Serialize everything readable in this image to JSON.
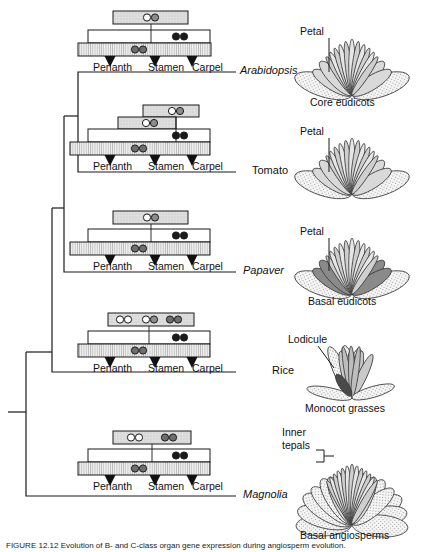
{
  "figure": {
    "caption": "FIGURE 12.12  Evolution of B- and C-class organ gene expression during angiosperm evolution."
  },
  "organ_labels": {
    "perianth": "Perianth",
    "stamen": "Stamen",
    "carpel": "Carpel"
  },
  "panels": [
    {
      "id": "arabidopsis",
      "taxon": "Arabidopsis",
      "taxon_italic": true,
      "clade": "Core eudicots",
      "callout": "Petal",
      "flower_type": "radial-eudicot",
      "petal_shade": "light",
      "bars": [
        {
          "role": "A",
          "x": 113,
          "y": 11,
          "w": 75,
          "h": 13,
          "fill": "#dedede",
          "hatch": "coarse",
          "circles": [
            {
              "dx": 34,
              "fill": "#ffffff"
            },
            {
              "dx": 42,
              "fill": "#8c8c8c"
            }
          ]
        },
        {
          "role": "B",
          "x": 88,
          "y": 30,
          "w": 122,
          "h": 13,
          "fill": "#ffffff",
          "hatch": "none",
          "circles": [
            {
              "dx": 88,
              "fill": "#1a1a1a"
            },
            {
              "dx": 96,
              "fill": "#1a1a1a"
            }
          ]
        },
        {
          "role": "C",
          "x": 78,
          "y": 43,
          "w": 133,
          "h": 13,
          "fill": "#e8e8e8",
          "hatch": "fine",
          "circles": [
            {
              "dx": 57,
              "fill": "#6e6e6e"
            },
            {
              "dx": 65,
              "fill": "#6e6e6e"
            }
          ]
        }
      ],
      "arrows": [
        {
          "x": 110,
          "y": 56
        },
        {
          "x": 155,
          "y": 56
        },
        {
          "x": 192,
          "y": 56
        }
      ],
      "organ_label_y": 62,
      "organ_label_x": [
        93,
        148,
        185
      ]
    },
    {
      "id": "tomato",
      "taxon": "Tomato",
      "taxon_italic": false,
      "clade": "",
      "callout": "Petal",
      "flower_type": "radial-eudicot",
      "petal_shade": "light",
      "bars": [
        {
          "role": "A2",
          "x": 143,
          "y": 105,
          "w": 56,
          "h": 12,
          "fill": "#dedede",
          "hatch": "coarse",
          "circles": [
            {
              "dx": 29,
              "fill": "#ffffff"
            },
            {
              "dx": 37,
              "fill": "#8c8c8c"
            }
          ]
        },
        {
          "role": "A",
          "x": 118,
          "y": 117,
          "w": 58,
          "h": 12,
          "fill": "#dedede",
          "hatch": "coarse",
          "circles": [
            {
              "dx": 28,
              "fill": "#ffffff"
            },
            {
              "dx": 36,
              "fill": "#8c8c8c"
            }
          ]
        },
        {
          "role": "B",
          "x": 88,
          "y": 129,
          "w": 122,
          "h": 13,
          "fill": "#ffffff",
          "hatch": "none",
          "circles": [
            {
              "dx": 88,
              "fill": "#1a1a1a"
            },
            {
              "dx": 96,
              "fill": "#1a1a1a"
            }
          ]
        },
        {
          "role": "C",
          "x": 70,
          "y": 142,
          "w": 140,
          "h": 13,
          "fill": "#e8e8e8",
          "hatch": "fine",
          "circles": [
            {
              "dx": 65,
              "fill": "#6e6e6e"
            },
            {
              "dx": 73,
              "fill": "#6e6e6e"
            }
          ]
        }
      ],
      "arrows": [
        {
          "x": 110,
          "y": 155
        },
        {
          "x": 155,
          "y": 155
        },
        {
          "x": 192,
          "y": 155
        }
      ],
      "organ_label_y": 161,
      "organ_label_x": [
        93,
        148,
        185
      ]
    },
    {
      "id": "papaver",
      "taxon": "Papaver",
      "taxon_italic": true,
      "clade": "Basal eudicots",
      "callout": "Petal",
      "flower_type": "radial-eudicot",
      "petal_shade": "dark",
      "bars": [
        {
          "role": "A",
          "x": 113,
          "y": 211,
          "w": 75,
          "h": 13,
          "fill": "#dedede",
          "hatch": "coarse",
          "circles": [
            {
              "dx": 34,
              "fill": "#ffffff"
            },
            {
              "dx": 42,
              "fill": "#8c8c8c"
            }
          ]
        },
        {
          "role": "B",
          "x": 88,
          "y": 229,
          "w": 122,
          "h": 13,
          "fill": "#ffffff",
          "hatch": "none",
          "circles": [
            {
              "dx": 88,
              "fill": "#1a1a1a"
            },
            {
              "dx": 96,
              "fill": "#1a1a1a"
            }
          ]
        },
        {
          "role": "C",
          "x": 70,
          "y": 242,
          "w": 140,
          "h": 13,
          "fill": "#e8e8e8",
          "hatch": "fine",
          "circles": [
            {
              "dx": 65,
              "fill": "#6e6e6e"
            },
            {
              "dx": 73,
              "fill": "#6e6e6e"
            }
          ]
        }
      ],
      "arrows": [
        {
          "x": 110,
          "y": 255
        },
        {
          "x": 155,
          "y": 255
        },
        {
          "x": 192,
          "y": 255
        }
      ],
      "organ_label_y": 261,
      "organ_label_x": [
        93,
        148,
        185
      ]
    },
    {
      "id": "rice",
      "taxon": "Rice",
      "taxon_italic": false,
      "clade": "Monocot grasses",
      "callout": "Lodicule",
      "flower_type": "grass",
      "petal_shade": "light",
      "bars": [
        {
          "role": "A",
          "x": 108,
          "y": 313,
          "w": 86,
          "h": 13,
          "fill": "#dedede",
          "hatch": "coarse",
          "circles": [
            {
              "dx": 12,
              "fill": "#ffffff"
            },
            {
              "dx": 20,
              "fill": "#ffffff"
            },
            {
              "dx": 38,
              "fill": "#ffffff"
            },
            {
              "dx": 46,
              "fill": "#8c8c8c"
            },
            {
              "dx": 62,
              "fill": "#6e6e6e"
            },
            {
              "dx": 70,
              "fill": "#6e6e6e"
            }
          ]
        },
        {
          "role": "B",
          "x": 88,
          "y": 331,
          "w": 122,
          "h": 13,
          "fill": "#ffffff",
          "hatch": "none",
          "circles": [
            {
              "dx": 88,
              "fill": "#1a1a1a"
            },
            {
              "dx": 96,
              "fill": "#1a1a1a"
            }
          ]
        },
        {
          "role": "C",
          "x": 78,
          "y": 344,
          "w": 132,
          "h": 13,
          "fill": "#e8e8e8",
          "hatch": "fine",
          "circles": [
            {
              "dx": 57,
              "fill": "#6e6e6e"
            },
            {
              "dx": 65,
              "fill": "#6e6e6e"
            }
          ]
        }
      ],
      "arrows": [
        {
          "x": 110,
          "y": 357
        },
        {
          "x": 155,
          "y": 357
        },
        {
          "x": 192,
          "y": 357
        }
      ],
      "organ_label_y": 363,
      "organ_label_x": [
        93,
        148,
        185
      ]
    },
    {
      "id": "magnolia",
      "taxon": "Magnolia",
      "taxon_italic": true,
      "clade": "Basal angiosperms",
      "callout": "Inner\ntepals",
      "callout_line1": "Inner",
      "callout_line2": "tepals",
      "flower_type": "radial-full",
      "petal_shade": "light",
      "bars": [
        {
          "role": "A",
          "x": 113,
          "y": 431,
          "w": 78,
          "h": 13,
          "fill": "#dedede",
          "hatch": "coarse",
          "circles": [
            {
              "dx": 18,
              "fill": "#ffffff"
            },
            {
              "dx": 26,
              "fill": "#ffffff"
            },
            {
              "dx": 52,
              "fill": "#6e6e6e"
            },
            {
              "dx": 60,
              "fill": "#6e6e6e"
            }
          ]
        },
        {
          "role": "B",
          "x": 88,
          "y": 449,
          "w": 122,
          "h": 13,
          "fill": "#ffffff",
          "hatch": "none",
          "circles": [
            {
              "dx": 88,
              "fill": "#1a1a1a"
            },
            {
              "dx": 96,
              "fill": "#1a1a1a"
            }
          ]
        },
        {
          "role": "C",
          "x": 78,
          "y": 462,
          "w": 132,
          "h": 13,
          "fill": "#e8e8e8",
          "hatch": "fine",
          "circles": [
            {
              "dx": 57,
              "fill": "#6e6e6e"
            },
            {
              "dx": 65,
              "fill": "#6e6e6e"
            }
          ]
        }
      ],
      "arrows": [
        {
          "x": 110,
          "y": 475
        },
        {
          "x": 155,
          "y": 475
        },
        {
          "x": 192,
          "y": 475
        }
      ],
      "organ_label_y": 481,
      "organ_label_x": [
        93,
        148,
        185
      ]
    }
  ],
  "colors": {
    "stroke": "#1a1a1a",
    "circle_white": "#ffffff",
    "circle_gray": "#8c8c8c",
    "circle_darkgray": "#6e6e6e",
    "circle_black": "#1a1a1a",
    "bar_a": "#dedede",
    "bar_c": "#e8e8e8",
    "petal_light": "#d9d9d9",
    "petal_dark": "#8a8a8a",
    "sepal": "#f2f2f2",
    "inner": "#c9c9c9"
  }
}
